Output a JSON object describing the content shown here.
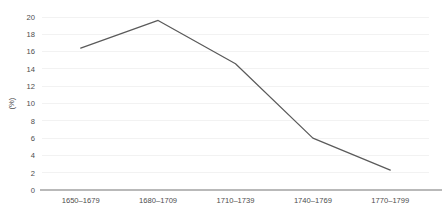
{
  "chart_data": {
    "type": "line",
    "title": "",
    "subtitle": "",
    "xlabel": "",
    "ylabel": "(%)",
    "categories": [
      "1650–1679",
      "1680–1709",
      "1710–1739",
      "1740–1769",
      "1770–1799"
    ],
    "series": [
      {
        "name": "",
        "values": [
          16.4,
          19.6,
          14.6,
          6.0,
          2.3
        ]
      }
    ],
    "ylim": [
      0,
      20
    ],
    "ytick_values": [
      0,
      2,
      4,
      6,
      8,
      10,
      12,
      14,
      16,
      18,
      20
    ],
    "ytick_labels": [
      "0",
      "2",
      "4",
      "6",
      "8",
      "10",
      "12",
      "14",
      "16",
      "18",
      "20"
    ],
    "grid": "horizontal",
    "legend": "none",
    "annotations": [],
    "colors": {
      "line": "#5a5a5a",
      "gridline": "#f2f2f2",
      "axis": "#b9b9b9",
      "text": "#4d4d4d",
      "background": "#ffffff"
    }
  }
}
